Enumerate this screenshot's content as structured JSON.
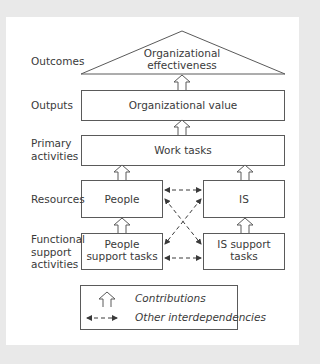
{
  "levels": {
    "outcomes": "Outcomes",
    "outputs": "Outputs",
    "primary_line1": "Primary",
    "primary_line2": "activities",
    "resources": "Resources",
    "functional_line1": "Functional",
    "functional_line2": "support",
    "functional_line3": "activities"
  },
  "nodes": {
    "effectiveness_line1": "Organizational",
    "effectiveness_line2": "effectiveness",
    "value": "Organizational value",
    "work_tasks": "Work tasks",
    "people": "People",
    "is": "IS",
    "people_support_line1": "People",
    "people_support_line2": "support tasks",
    "is_support_line1": "IS support",
    "is_support_line2": "tasks"
  },
  "legend": {
    "contributions": "Contributions",
    "interdependencies": "Other interdependencies"
  },
  "colors": {
    "frame": "#e9e9e9",
    "line": "#5a5a5a",
    "text": "#3a3a3a"
  }
}
